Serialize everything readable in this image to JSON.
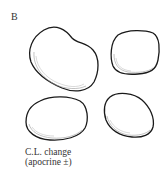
{
  "figure": {
    "panel_label": "B",
    "caption_line1": "C.L. change",
    "caption_line2": "(apocrine ±)",
    "colors": {
      "outline": "#1a1a1a",
      "shading": "#9a9a9a",
      "background": "#ffffff"
    }
  }
}
